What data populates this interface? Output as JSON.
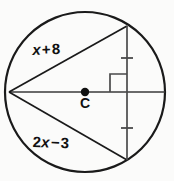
{
  "figure": {
    "name": "circle-with-chords",
    "background_color": "#fbfbfa",
    "stroke_color": "#1a1a1a",
    "label_color": "#111111",
    "circle": {
      "center_x": 85,
      "center_y": 92,
      "radius": 80,
      "stroke_width": 2.2
    },
    "center_point": {
      "label": "C",
      "dot_radius": 4,
      "dot_x": 85,
      "dot_y": 92
    },
    "labels": {
      "chord_upper": {
        "full_text": "x + 8",
        "variable": "x",
        "operator": "+",
        "constant": "8"
      },
      "chord_lower": {
        "full_text": "2x − 3",
        "coefficient": "2",
        "variable": "x",
        "operator": "−",
        "constant": "3"
      }
    },
    "segments": [
      {
        "name": "horizontal-diameter",
        "x1": 9,
        "y1": 92,
        "x2": 165,
        "y2": 92,
        "stroke_width": 1.7
      },
      {
        "name": "chord-upper",
        "x1": 9,
        "y1": 92,
        "x2": 127,
        "y2": 26,
        "stroke_width": 1.7
      },
      {
        "name": "chord-lower",
        "x1": 9,
        "y1": 92,
        "x2": 127,
        "y2": 160,
        "stroke_width": 1.7
      },
      {
        "name": "vertical-chord",
        "x1": 127,
        "y1": 26,
        "x2": 127,
        "y2": 160,
        "stroke_width": 1.7
      }
    ],
    "right_angle_marker": {
      "name": "right-angle-square",
      "x": 110,
      "y": 73,
      "size": 17,
      "stroke_width": 1.7
    },
    "tick_marks": [
      {
        "name": "congruence-tick-upper",
        "cx": 127,
        "cy": 58,
        "half_width": 6,
        "stroke_width": 1.7
      },
      {
        "name": "congruence-tick-lower",
        "cx": 127,
        "cy": 128,
        "half_width": 6,
        "stroke_width": 1.7
      }
    ]
  }
}
